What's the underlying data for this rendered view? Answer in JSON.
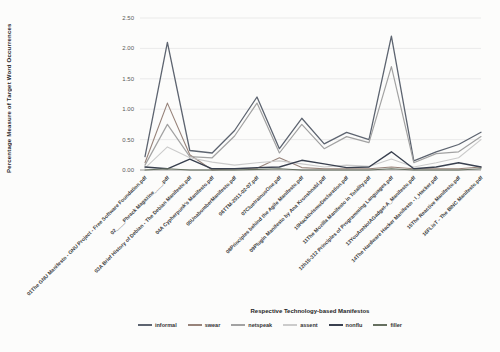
{
  "chart_data": {
    "type": "line",
    "xlabel": "Respective Technology-based Manifestos",
    "ylabel": "Percentage Measure of Target Word Occurrences",
    "ylim": [
      0,
      2.5
    ],
    "yticks": [
      "0.00",
      "0.50",
      "1.00",
      "1.50",
      "2.00",
      "2.50"
    ],
    "grid": true,
    "legend_position": "bottom",
    "grid_color": "#e2e2e2",
    "axis_color": "#9a9a9a",
    "tick_label_color": "#595959",
    "x_label_color": "#3d3d3d",
    "categories": [
      "01The GNU Manifesto - GNU Project - Free Software Foundation.pdf",
      "02____Phrack Magazine____.pdf",
      "03A Brief History of Debian - The Debian Manifesto.pdf",
      "04A Cypherpunk's Manifesto.pdf",
      "05UnabomberManifesto.pdf",
      "06TTM-2011-02-07.pdf",
      "07CluetrainusOne.pdf",
      "08Principles behind the Agile Manifesto.pdf",
      "09Plugin Manifesto by Ana Kronshnabl.pdf",
      "10HacktivismoDeclaration.pdf",
      "11The Mozilla Manifesto in Totality.pdf",
      "12h15-312 Principles of Programming Languages.pdf",
      "13YouAreNotAGadget-A_Manifesto.pdf",
      "14The Hardware Hacker Manifesto - I_Hacker.pdf",
      "15The Reactive Manifesto.pdf",
      "16FLisT - The BINC Manifesto.pdf"
    ],
    "series": [
      {
        "name": "informal",
        "color": "#5d6470",
        "width": 1.3,
        "values": [
          0.22,
          2.1,
          0.32,
          0.28,
          0.65,
          1.2,
          0.35,
          0.85,
          0.43,
          0.62,
          0.5,
          2.2,
          0.15,
          0.3,
          0.42,
          0.62
        ]
      },
      {
        "name": "swear",
        "color": "#97837a",
        "width": 1.1,
        "values": [
          0.12,
          1.1,
          0.25,
          0.0,
          0.02,
          0.03,
          0.2,
          0.04,
          0.02,
          0.02,
          0.02,
          0.05,
          0.02,
          0.02,
          0.02,
          0.05
        ]
      },
      {
        "name": "netspeak",
        "color": "#a2a2a2",
        "width": 1.2,
        "values": [
          0.08,
          0.75,
          0.22,
          0.2,
          0.56,
          1.1,
          0.28,
          0.75,
          0.35,
          0.55,
          0.45,
          1.7,
          0.12,
          0.27,
          0.3,
          0.55
        ]
      },
      {
        "name": "assent",
        "color": "#cbcbcb",
        "width": 1.1,
        "values": [
          0.03,
          0.38,
          0.2,
          0.13,
          0.08,
          0.12,
          0.15,
          0.1,
          0.05,
          0.08,
          0.06,
          0.18,
          0.05,
          0.12,
          0.2,
          0.5
        ]
      },
      {
        "name": "nonflu",
        "color": "#39404f",
        "width": 1.4,
        "values": [
          0.05,
          0.02,
          0.18,
          0.02,
          0.02,
          0.04,
          0.05,
          0.16,
          0.1,
          0.04,
          0.05,
          0.3,
          0.02,
          0.05,
          0.12,
          0.05
        ]
      },
      {
        "name": "filler",
        "color": "#667060",
        "width": 1.1,
        "values": [
          0.0,
          0.02,
          0.0,
          0.0,
          0.0,
          0.01,
          0.02,
          0.0,
          0.0,
          0.0,
          0.0,
          0.02,
          0.0,
          0.0,
          0.0,
          0.02
        ]
      }
    ]
  }
}
